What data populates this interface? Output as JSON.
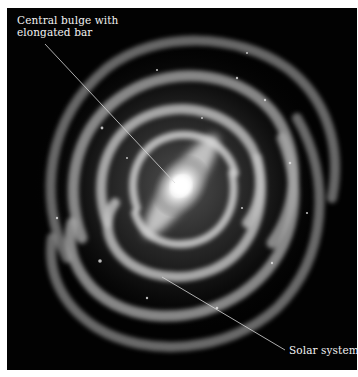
{
  "image": {
    "subject": "Milky Way spiral galaxy (face-on illustration)",
    "background_color": "#020202",
    "border_color": "#ffffff"
  },
  "labels": [
    {
      "id": "bulge",
      "lines": [
        "Central bulge with",
        "elongated bar"
      ]
    },
    {
      "id": "solar",
      "lines": [
        "Solar system"
      ]
    }
  ],
  "leader_lines": [
    {
      "label": "bulge",
      "from": [
        38,
        36
      ],
      "to": [
        168,
        175
      ]
    },
    {
      "label": "solar",
      "from": [
        155,
        269
      ],
      "to": [
        278,
        342
      ]
    }
  ],
  "colors": {
    "text": "#f2f2f2",
    "leader": "#d8d8d8",
    "core": "#ffffff",
    "arms": "#9a9a9a"
  }
}
